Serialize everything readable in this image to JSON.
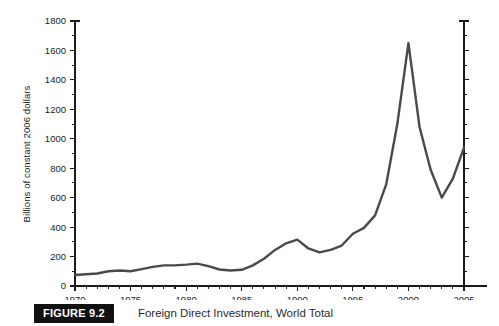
{
  "caption": {
    "badge": "FIGURE 9.2",
    "title": "Foreign Direct Investment, World Total"
  },
  "chart_data": {
    "type": "line",
    "title": "Foreign Direct Investment, World Total",
    "xlabel": "",
    "ylabel": "Billions of constant 2006 dollars",
    "xlim": [
      1970,
      2005
    ],
    "ylim": [
      0,
      1800
    ],
    "grid": false,
    "legend": null,
    "line_color": "#4a4a4a",
    "x_tick_labels": [
      "1970",
      "1975",
      "1980",
      "1985",
      "1990",
      "1995",
      "2000",
      "2005"
    ],
    "x_major_ticks": [
      1970,
      1975,
      1980,
      1985,
      1990,
      1995,
      2000,
      2005
    ],
    "x_minor_step": 1,
    "y_tick_labels": [
      "0",
      "200",
      "400",
      "600",
      "800",
      "1000",
      "1200",
      "1400",
      "1600",
      "1800"
    ],
    "y_major_ticks": [
      0,
      200,
      400,
      600,
      800,
      1000,
      1200,
      1400,
      1600,
      1800
    ],
    "y_minor_step": 100,
    "x": [
      1970,
      1971,
      1972,
      1973,
      1974,
      1975,
      1976,
      1977,
      1978,
      1979,
      1980,
      1981,
      1982,
      1983,
      1984,
      1985,
      1986,
      1987,
      1988,
      1989,
      1990,
      1991,
      1992,
      1993,
      1994,
      1995,
      1996,
      1997,
      1998,
      1999,
      2000,
      2001,
      2002,
      2003,
      2004,
      2005
    ],
    "values": [
      75,
      80,
      85,
      100,
      105,
      100,
      115,
      130,
      140,
      140,
      145,
      152,
      135,
      112,
      105,
      110,
      140,
      185,
      245,
      290,
      315,
      255,
      228,
      245,
      275,
      355,
      395,
      480,
      690,
      1100,
      1650,
      1080,
      790,
      600,
      730,
      940
    ]
  }
}
